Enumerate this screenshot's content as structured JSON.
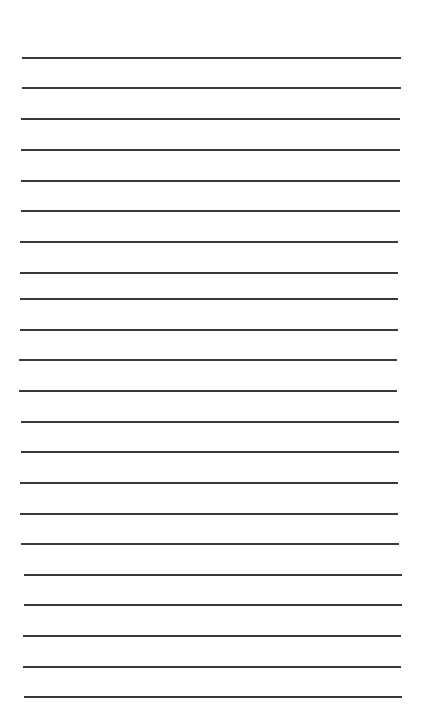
{
  "page": {
    "type": "lined-paper",
    "background": "#ffffff",
    "line_color": "#3a3a3a",
    "line_count": 22,
    "lines": [
      {
        "y": 58,
        "x1": 22,
        "x2": 401
      },
      {
        "y": 88,
        "x1": 22,
        "x2": 401
      },
      {
        "y": 119,
        "x1": 21,
        "x2": 400
      },
      {
        "y": 150,
        "x1": 21,
        "x2": 400
      },
      {
        "y": 181,
        "x1": 21,
        "x2": 400
      },
      {
        "y": 211,
        "x1": 21,
        "x2": 400
      },
      {
        "y": 242,
        "x1": 20,
        "x2": 398
      },
      {
        "y": 273,
        "x1": 20,
        "x2": 398
      },
      {
        "y": 299,
        "x1": 20,
        "x2": 398
      },
      {
        "y": 330,
        "x1": 20,
        "x2": 398
      },
      {
        "y": 360,
        "x1": 19,
        "x2": 397
      },
      {
        "y": 391,
        "x1": 19,
        "x2": 397
      },
      {
        "y": 422,
        "x1": 21,
        "x2": 399
      },
      {
        "y": 452,
        "x1": 21,
        "x2": 399
      },
      {
        "y": 483,
        "x1": 20,
        "x2": 398
      },
      {
        "y": 514,
        "x1": 20,
        "x2": 398
      },
      {
        "y": 544,
        "x1": 21,
        "x2": 399
      },
      {
        "y": 575,
        "x1": 24,
        "x2": 402
      },
      {
        "y": 605,
        "x1": 24,
        "x2": 402
      },
      {
        "y": 636,
        "x1": 23,
        "x2": 401
      },
      {
        "y": 667,
        "x1": 23,
        "x2": 401
      },
      {
        "y": 697,
        "x1": 24,
        "x2": 402
      }
    ]
  }
}
